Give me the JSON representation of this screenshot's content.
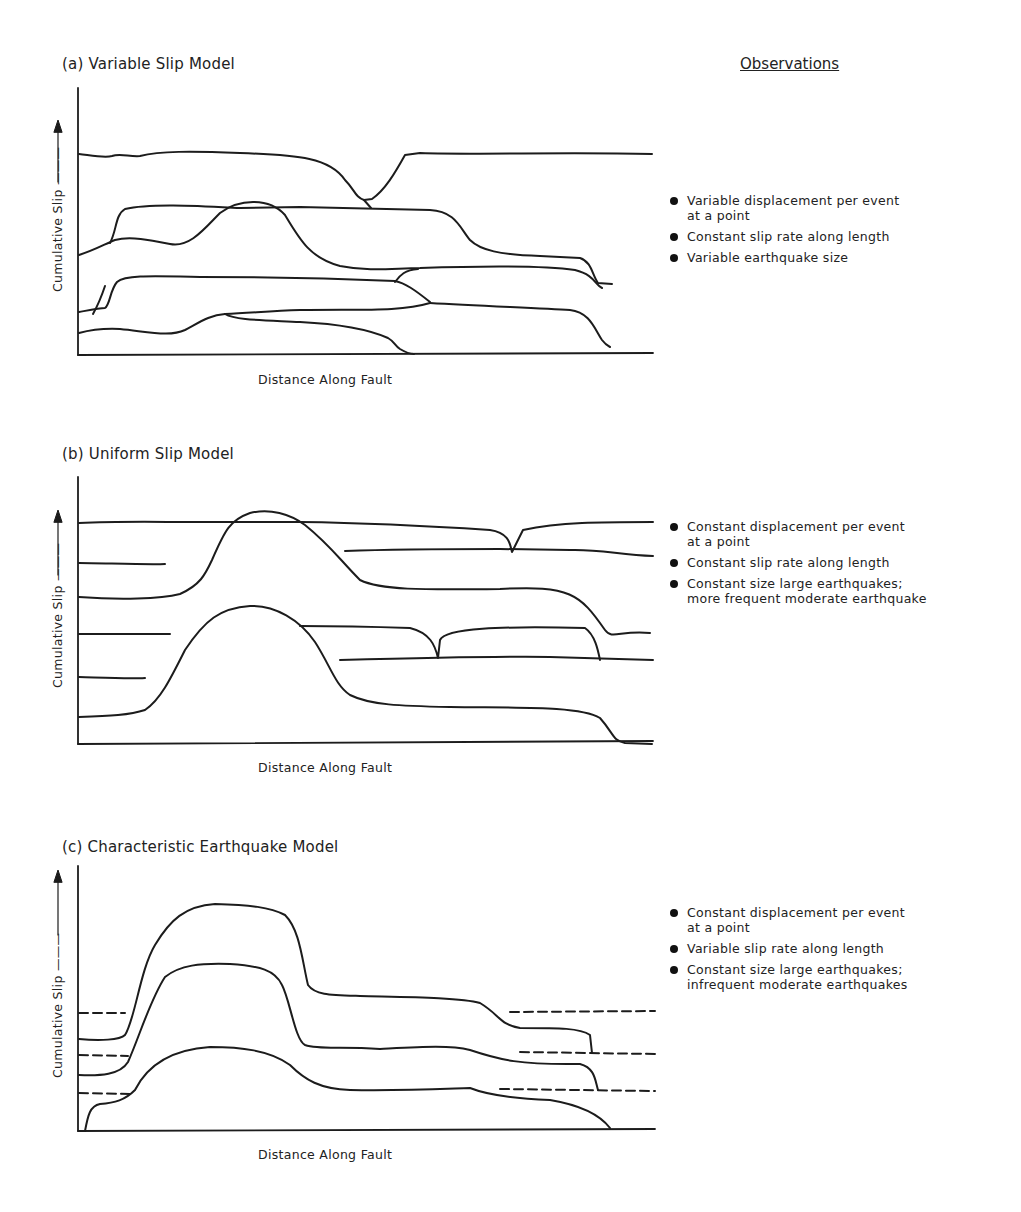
{
  "observations_header": "Observations",
  "panels": [
    {
      "id": "a",
      "title": "(a)  Variable Slip Model",
      "xlabel": "Distance Along Fault",
      "ylabel": "Cumulative Slip",
      "observations": [
        [
          "Variable displacement per event",
          "at a point"
        ],
        [
          "Constant slip rate along length"
        ],
        [
          "Variable earthquake size"
        ]
      ]
    },
    {
      "id": "b",
      "title": "(b)  Uniform Slip Model",
      "xlabel": "Distance Along Fault",
      "ylabel": "Cumulative Slip",
      "observations": [
        [
          "Constant displacement per event",
          "at a point"
        ],
        [
          "Constant slip rate along length"
        ],
        [
          "Constant size large earthquakes;",
          "more frequent moderate earthquake"
        ]
      ]
    },
    {
      "id": "c",
      "title": "(c)  Characteristic Earthquake Model",
      "xlabel": "Distance Along Fault",
      "ylabel": "Cumulative Slip",
      "observations": [
        [
          "Constant displacement per event",
          "at a point"
        ],
        [
          "Variable slip rate along length"
        ],
        [
          "Constant size large earthquakes;",
          "infrequent moderate earthquakes"
        ]
      ]
    }
  ]
}
